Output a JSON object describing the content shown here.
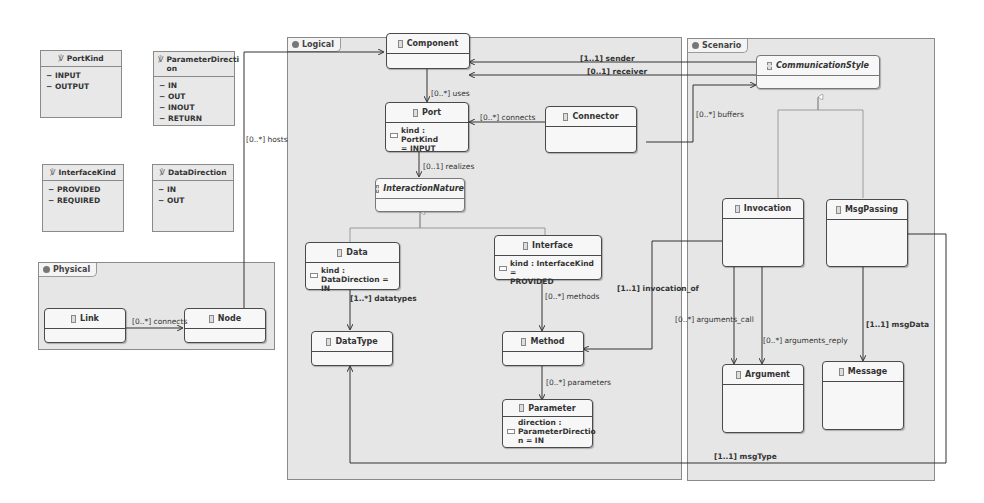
{
  "enums": [
    {
      "name": "PortKind",
      "literals": [
        "INPUT",
        "OUTPUT"
      ]
    },
    {
      "name": "ParameterDirecti\non",
      "literals": [
        "IN",
        "OUT",
        "INOUT",
        "RETURN"
      ]
    },
    {
      "name": "InterfaceKind",
      "literals": [
        "PROVIDED",
        "REQUIRED"
      ]
    },
    {
      "name": "DataDirection",
      "literals": [
        "IN",
        "OUT"
      ]
    }
  ],
  "packages": {
    "physical": "Physical",
    "logical": "Logical",
    "scenario": "Scenario"
  },
  "classes": {
    "link": {
      "name": "Link"
    },
    "node": {
      "name": "Node"
    },
    "component": {
      "name": "Component"
    },
    "port": {
      "name": "Port",
      "attr": "kind : PortKind\n= INPUT"
    },
    "connector": {
      "name": "Connector"
    },
    "interaction_nature": {
      "name": "InteractionNature"
    },
    "data": {
      "name": "Data",
      "attr": "kind :\nDataDirection = IN"
    },
    "interface": {
      "name": "Interface",
      "attr": "kind : InterfaceKind =\nPROVIDED"
    },
    "datatype": {
      "name": "DataType"
    },
    "method": {
      "name": "Method"
    },
    "parameter": {
      "name": "Parameter",
      "attr": "direction :\nParameterDirectio\nn = IN"
    },
    "communication_style": {
      "name": "CommunicationStyle"
    },
    "invocation": {
      "name": "Invocation"
    },
    "msgpassing": {
      "name": "MsgPassing"
    },
    "argument": {
      "name": "Argument"
    },
    "message": {
      "name": "Message"
    }
  },
  "relations": {
    "connects_link": "[0..*] connects",
    "hosts": "[0..*] hosts",
    "uses": "[0..*] uses",
    "connects_port": "[0..*] connects",
    "realizes": "[0..1] realizes",
    "datatypes": "[1..*] datatypes",
    "methods": "[0..*] methods",
    "parameters": "[0..*] parameters",
    "sender": "[1..1] sender",
    "receiver": "[0..1] receiver",
    "buffers": "[0..*] buffers",
    "invocation_of": "[1..1] invocation_of",
    "arguments_call": "[0..*] arguments_call",
    "arguments_reply": "[0..*] arguments_reply",
    "msgData": "[1..1] msgData",
    "msgType": "[1..1] msgType"
  }
}
